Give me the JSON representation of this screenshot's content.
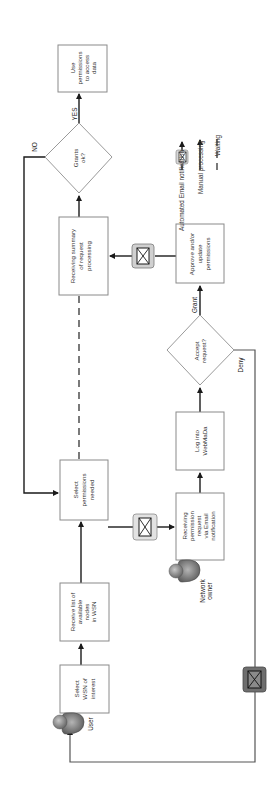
{
  "diagram": {
    "orientation": "rotated 90 degrees clockwise (read with page turned)",
    "legend": {
      "email": "Automated Email notification",
      "manual": "Manual processing",
      "waiting": "Waiting"
    },
    "actors": {
      "user": "User",
      "owner_line1": "Network",
      "owner_line2": "owner"
    },
    "nodes": {
      "select_wsn": [
        "Select",
        "WSN of",
        "interest"
      ],
      "receive_list": [
        "Receive list of",
        "available",
        "nodes",
        "in WSN"
      ],
      "select_permissions": [
        "Select",
        "permissions",
        "needed"
      ],
      "receiving_request": [
        "Receiving",
        "permission",
        "request",
        "via Email",
        "notification"
      ],
      "log_into": [
        "Log into",
        "WebMaDa"
      ],
      "accept_request": [
        "Accept",
        "request?"
      ],
      "approve_update": [
        "Approve and/or",
        "update",
        "permissions"
      ],
      "receiving_summary": [
        "Receiving summary",
        "of request",
        "processing"
      ],
      "grants_ok": [
        "Grants",
        "ok?"
      ],
      "use_permissions": [
        "Use",
        "permissions",
        "to access",
        "data"
      ]
    },
    "edge_labels": {
      "yes": "YES",
      "no": "NO",
      "grant": "Grant",
      "deny": "Deny"
    },
    "colors": {
      "line": "#1a1a1a",
      "box_border": "#8a8a8a",
      "email_icon_light": "#d0d0d0",
      "email_icon_dark": "#6e6e6e",
      "person": "#8c8c8c"
    }
  }
}
